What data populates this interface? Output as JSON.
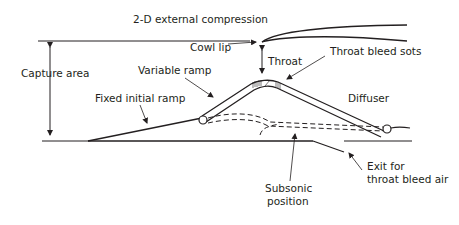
{
  "diagram": {
    "title": "2-D external compression",
    "labels": {
      "cowl_lip": "Cowl lip",
      "capture_area": "Capture area",
      "variable_ramp": "Variable ramp",
      "fixed_initial_ramp": "Fixed initial ramp",
      "throat": "Throat",
      "throat_bleed_slots": "Throat bleed sots",
      "diffuser": "Diffuser",
      "subsonic_position_1": "Subsonic",
      "subsonic_position_2": "position",
      "exit_bleed_1": "Exit for",
      "exit_bleed_2": "throat bleed air"
    },
    "colors": {
      "line": "#231f20",
      "background": "#ffffff"
    }
  }
}
